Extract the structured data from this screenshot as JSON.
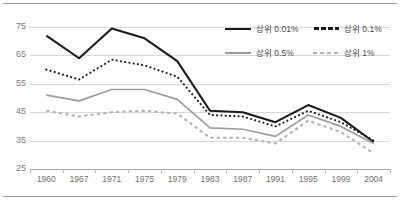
{
  "chart_data": {
    "type": "line",
    "title": "",
    "subtitle": "",
    "xlabel": "",
    "ylabel": "",
    "grid": true,
    "legend_position": "top-right",
    "categories": [
      "1960",
      "1967",
      "1971",
      "1975",
      "1979",
      "1983",
      "1987",
      "1991",
      "1995",
      "1999",
      "2004"
    ],
    "x": [
      1960,
      1967,
      1971,
      1975,
      1979,
      1983,
      1987,
      1991,
      1995,
      1999,
      2004
    ],
    "ylim": [
      25,
      75
    ],
    "yticks": [
      25,
      35,
      45,
      55,
      65,
      75
    ],
    "series": [
      {
        "name": "са́",
        "label": "상위 0.01%",
        "style": "solid",
        "color": "#1a1a1a",
        "values": [
          72.0,
          64.0,
          74.5,
          71.0,
          63.0,
          45.5,
          45.0,
          41.5,
          47.5,
          43.0,
          34.5
        ]
      },
      {
        "label": "상위 0.1%",
        "style": "dotted",
        "color": "#1a1a1a",
        "values": [
          60.0,
          56.5,
          63.5,
          61.5,
          57.5,
          44.0,
          43.5,
          40.0,
          45.5,
          41.5,
          35.0
        ]
      },
      {
        "label": "상위 0.5%",
        "style": "solid",
        "color": "#9c9c9c",
        "values": [
          51.0,
          49.0,
          53.0,
          53.0,
          49.5,
          39.5,
          39.0,
          36.5,
          44.0,
          40.0,
          34.0
        ]
      },
      {
        "label": "상위 1%",
        "style": "dashed",
        "color": "#b2b2b2",
        "values": [
          45.5,
          43.5,
          45.0,
          45.5,
          44.5,
          36.0,
          36.0,
          34.0,
          42.0,
          38.0,
          30.5
        ]
      }
    ],
    "colors": {
      "series_1": "#1a1a1a",
      "series_2": "#1a1a1a",
      "series_3": "#9c9c9c",
      "series_4": "#b2b2b2",
      "grid": "#d9d9d9",
      "axis": "#a6a6a6",
      "tick_text": "#7b7b7b",
      "frame": "#9a9a9a",
      "background": "#ffffff"
    }
  }
}
